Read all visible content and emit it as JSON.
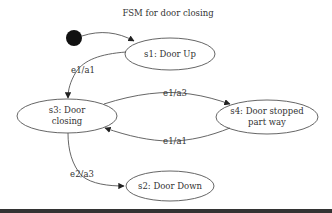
{
  "diagram": {
    "title": "FSM for door closing",
    "colors": {
      "stroke": "#555555",
      "text": "#333333",
      "start_fill": "#111111",
      "background": "#ffffff",
      "bottom_bar": "#333333"
    },
    "start_node": {
      "id": "start",
      "shape": "filled-circle"
    },
    "nodes": [
      {
        "id": "s1",
        "lines": [
          "s1:  Door Up"
        ]
      },
      {
        "id": "s2",
        "lines": [
          "s2:  Door Down"
        ]
      },
      {
        "id": "s3",
        "lines": [
          "s3:  Door",
          "closing"
        ]
      },
      {
        "id": "s4",
        "lines": [
          "s4:  Door stopped",
          "part way"
        ]
      }
    ],
    "edges": [
      {
        "from": "start",
        "to": "s1",
        "label": ""
      },
      {
        "from": "s1",
        "to": "s3",
        "label": "e1/a1"
      },
      {
        "from": "s3",
        "to": "s4",
        "label": "e1/a3"
      },
      {
        "from": "s4",
        "to": "s3",
        "label": "e1/a1"
      },
      {
        "from": "s3",
        "to": "s2",
        "label": "e2/a3"
      }
    ]
  }
}
